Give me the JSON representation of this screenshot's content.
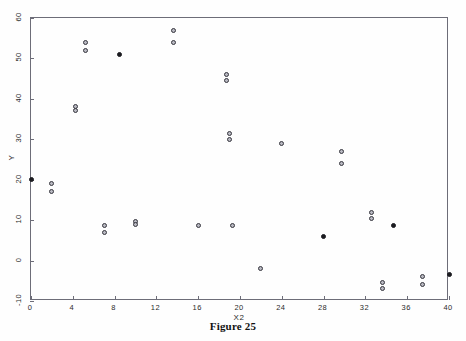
{
  "figure": {
    "caption": "Figure 25",
    "caption_top_px": 320
  },
  "chart_data": {
    "type": "scatter",
    "title": "",
    "subtitle": "",
    "xlabel": "X2",
    "ylabel": "Y",
    "xlim": [
      0,
      40
    ],
    "ylim": [
      -10,
      60
    ],
    "grid": false,
    "legend": null,
    "legend_position": "none",
    "x_ticks": [
      0,
      4,
      8,
      12,
      16,
      20,
      24,
      28,
      32,
      36,
      40
    ],
    "x_tick_labels": [
      "0",
      "4",
      "8",
      "12",
      "16",
      "20",
      "24",
      "28",
      "32",
      "36",
      "40"
    ],
    "y_ticks": [
      -10,
      0,
      10,
      20,
      30,
      40,
      50,
      60
    ],
    "y_tick_labels": [
      "-10",
      "0",
      "10",
      "20",
      "30",
      "40",
      "50",
      "60"
    ],
    "marker_styles": {
      "open": "open-circle",
      "filled": "filled-circle"
    },
    "points": [
      {
        "x": 0.0,
        "y": 20.0,
        "style": "filled"
      },
      {
        "x": 2.0,
        "y": 19.0,
        "style": "open"
      },
      {
        "x": 2.0,
        "y": 17.0,
        "style": "open"
      },
      {
        "x": 4.3,
        "y": 38.0,
        "style": "open"
      },
      {
        "x": 4.3,
        "y": 37.0,
        "style": "open"
      },
      {
        "x": 5.2,
        "y": 54.0,
        "style": "open"
      },
      {
        "x": 5.2,
        "y": 52.0,
        "style": "open"
      },
      {
        "x": 7.0,
        "y": 8.6,
        "style": "open"
      },
      {
        "x": 7.0,
        "y": 7.0,
        "style": "open"
      },
      {
        "x": 8.5,
        "y": 51.0,
        "style": "filled"
      },
      {
        "x": 10.0,
        "y": 9.7,
        "style": "open"
      },
      {
        "x": 10.0,
        "y": 8.8,
        "style": "open"
      },
      {
        "x": 13.6,
        "y": 57.0,
        "style": "open"
      },
      {
        "x": 13.6,
        "y": 54.0,
        "style": "open"
      },
      {
        "x": 16.0,
        "y": 8.7,
        "style": "open"
      },
      {
        "x": 18.7,
        "y": 46.0,
        "style": "open"
      },
      {
        "x": 18.7,
        "y": 44.5,
        "style": "open"
      },
      {
        "x": 19.0,
        "y": 31.5,
        "style": "open"
      },
      {
        "x": 19.0,
        "y": 30.0,
        "style": "open"
      },
      {
        "x": 19.3,
        "y": 8.7,
        "style": "open"
      },
      {
        "x": 22.0,
        "y": -2.0,
        "style": "open"
      },
      {
        "x": 24.0,
        "y": 29.0,
        "style": "open"
      },
      {
        "x": 28.0,
        "y": 6.0,
        "style": "filled"
      },
      {
        "x": 29.7,
        "y": 27.0,
        "style": "open"
      },
      {
        "x": 29.7,
        "y": 24.0,
        "style": "open"
      },
      {
        "x": 32.6,
        "y": 12.0,
        "style": "open"
      },
      {
        "x": 32.6,
        "y": 10.5,
        "style": "open"
      },
      {
        "x": 33.6,
        "y": -5.5,
        "style": "open"
      },
      {
        "x": 33.6,
        "y": -7.0,
        "style": "open"
      },
      {
        "x": 34.7,
        "y": 8.7,
        "style": "filled"
      },
      {
        "x": 37.5,
        "y": -4.0,
        "style": "open"
      },
      {
        "x": 37.5,
        "y": -6.0,
        "style": "open"
      },
      {
        "x": 40.0,
        "y": -3.5,
        "style": "filled"
      }
    ]
  },
  "geometry": {
    "plot_left": 30,
    "plot_top": 17,
    "plot_width": 418,
    "plot_height": 283
  },
  "colors": {
    "frame": "#6d6d78",
    "marker_open_edge": "#35353d",
    "marker_open_fill": "#b9b9c2",
    "marker_filled": "#1b1b20",
    "text": "#2b2b2b",
    "caption": "#111111",
    "background": "#fefefe"
  }
}
